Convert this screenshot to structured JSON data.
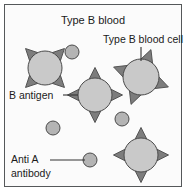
{
  "figure": {
    "title": "Type B blood",
    "background_color": "#fbfbfb",
    "frame_color": "#55585a",
    "labels": {
      "title": "Type B blood",
      "blood_cell": "Type B blood cell",
      "antigen": "B antigen",
      "antibody_line1": "Anti A",
      "antibody_line2": "antibody"
    },
    "colors": {
      "cell_body": "#c9c9c9",
      "antigen_spike": "#7d7d7d",
      "antibody": "#b4b4b4",
      "outline": "#4a4a4a",
      "text": "#1a1a1a",
      "leader_line": "#333333"
    }
  },
  "chart_data": {
    "type": "diagram",
    "title": "Type B blood",
    "blood_cells": [
      {
        "id": "cell-top-left",
        "cx": 45,
        "cy": 68,
        "r": 17,
        "spike_rotation": 45,
        "spikes": 4
      },
      {
        "id": "cell-center",
        "cx": 95,
        "cy": 95,
        "r": 17,
        "spike_rotation": 0,
        "spikes": 4
      },
      {
        "id": "cell-top-right",
        "cx": 141,
        "cy": 77,
        "r": 18,
        "spike_rotation": 20,
        "spikes": 4
      },
      {
        "id": "cell-bottom-right",
        "cx": 141,
        "cy": 155,
        "r": 17,
        "spike_rotation": 0,
        "spikes": 4
      }
    ],
    "antibodies": [
      {
        "id": "antibody-1",
        "cx": 72,
        "cy": 52,
        "r": 7
      },
      {
        "id": "antibody-2",
        "cx": 53,
        "cy": 128,
        "r": 7
      },
      {
        "id": "antibody-3",
        "cx": 122,
        "cy": 119,
        "r": 7
      },
      {
        "id": "antibody-legend",
        "cx": 90,
        "cy": 160,
        "r": 7
      }
    ],
    "annotations": [
      {
        "id": "title",
        "text": "Type B blood",
        "x": 93,
        "y": 24,
        "anchor": "middle",
        "font_size": 11
      },
      {
        "id": "blood-cell-label",
        "text": "Type B blood cell",
        "x": 143,
        "y": 43,
        "anchor": "middle",
        "font_size": 10.5
      },
      {
        "id": "antigen-label",
        "text": "B antigen",
        "x": 9,
        "y": 99,
        "anchor": "start",
        "font_size": 10.5
      },
      {
        "id": "antibody-label-1",
        "text": "Anti A",
        "x": 11,
        "y": 163,
        "anchor": "start",
        "font_size": 10.5
      },
      {
        "id": "antibody-label-2",
        "text": "antibody",
        "x": 11,
        "y": 177,
        "anchor": "start",
        "font_size": 10.5
      }
    ],
    "leader_lines": [
      {
        "id": "leader-blood-cell",
        "x1": 141,
        "y1": 47,
        "x2": 141,
        "y2": 61
      },
      {
        "id": "leader-antigen",
        "x1": 63,
        "y1": 95,
        "x2": 78,
        "y2": 95
      },
      {
        "id": "leader-antibody",
        "x1": 50,
        "y1": 160,
        "x2": 85,
        "y2": 160
      }
    ],
    "counts": {
      "blood_cells": 4,
      "antibodies": 4
    }
  }
}
